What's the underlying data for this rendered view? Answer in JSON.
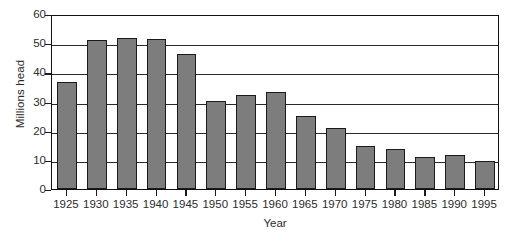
{
  "chart_data": {
    "type": "bar",
    "title": "",
    "xlabel": "Year",
    "ylabel": "Millions head",
    "categories": [
      "1925",
      "1930",
      "1935",
      "1940",
      "1945",
      "1950",
      "1955",
      "1960",
      "1965",
      "1970",
      "1975",
      "1980",
      "1985",
      "1990",
      "1995"
    ],
    "values": [
      36.8,
      51.0,
      51.7,
      51.5,
      46.3,
      30.2,
      32.2,
      33.2,
      25.1,
      20.9,
      14.9,
      13.6,
      11.0,
      11.7,
      9.7
    ],
    "ylim": [
      0,
      60
    ],
    "yticks": [
      0,
      10,
      20,
      30,
      40,
      50,
      60
    ],
    "ytick_labels": [
      "0",
      "10",
      "20",
      "30",
      "40",
      "50",
      "60"
    ],
    "grid": "horizontal",
    "legend": "none",
    "bar_color": "#7d7d7d",
    "bar_edge_color": "#1b1b1b",
    "axis_color": "#111111",
    "gridline_color": "#2a2a2a",
    "background_color": "#ffffff"
  }
}
